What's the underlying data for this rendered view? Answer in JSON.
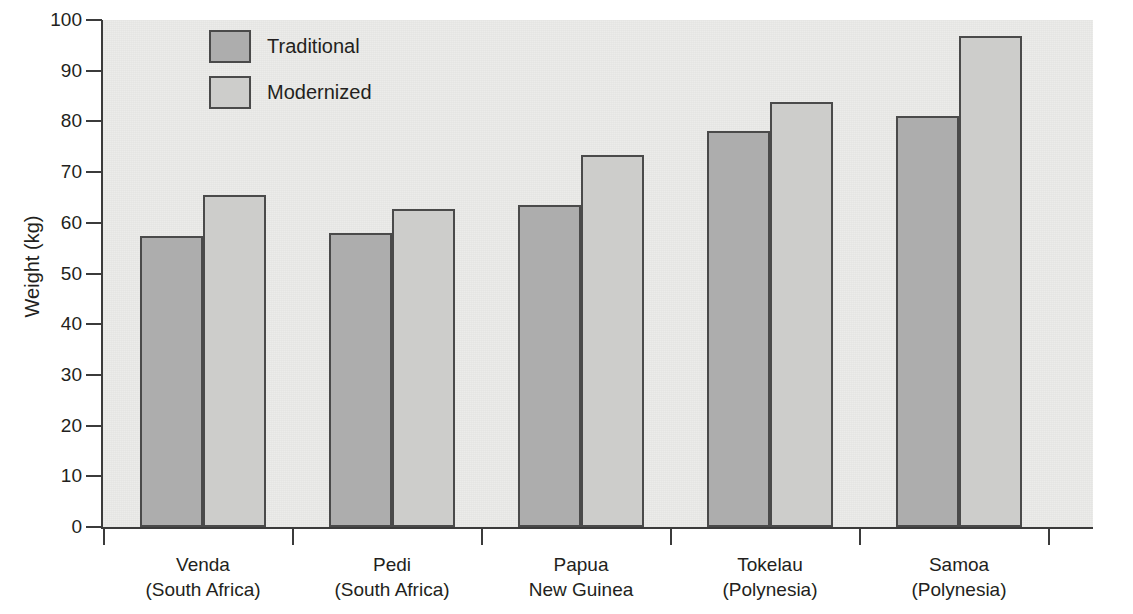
{
  "chart_data": {
    "type": "bar",
    "title": "",
    "xlabel": "",
    "ylabel": "Weight (kg)",
    "ylim": [
      0,
      100
    ],
    "ytick_step": 10,
    "ytick_labels": [
      "0",
      "10",
      "20",
      "30",
      "40",
      "50",
      "60",
      "70",
      "80",
      "90",
      "100"
    ],
    "grid": false,
    "legend_position": "top-left-inside",
    "categories": [
      "Venda\n(South Africa)",
      "Pedi\n(South Africa)",
      "Papua\nNew Guinea",
      "Tokelau\n(Polynesia)",
      "Samoa\n(Polynesia)"
    ],
    "category_lines": [
      [
        "Venda",
        "(South Africa)"
      ],
      [
        "Pedi",
        "(South Africa)"
      ],
      [
        "Papua",
        "New Guinea"
      ],
      [
        "Tokelau",
        "(Polynesia)"
      ],
      [
        "Samoa",
        "(Polynesia)"
      ]
    ],
    "series": [
      {
        "name": "Traditional",
        "color": "#adadad",
        "values": [
          57.4,
          57.9,
          63.5,
          78.2,
          81.0
        ]
      },
      {
        "name": "Modernized",
        "color": "#cdcdcb",
        "values": [
          65.5,
          62.8,
          73.3,
          83.8,
          96.8
        ]
      }
    ]
  },
  "legend": {
    "items": [
      {
        "label": "Traditional",
        "swatch": "traditional"
      },
      {
        "label": "Modernized",
        "swatch": "modernized"
      }
    ]
  },
  "colors": {
    "plot_background": "#ececea",
    "axis": "#3b3b3b",
    "bar_outline": "#4a4a4a",
    "traditional": "#adadad",
    "modernized": "#cdcdcb",
    "text": "#231f20"
  }
}
